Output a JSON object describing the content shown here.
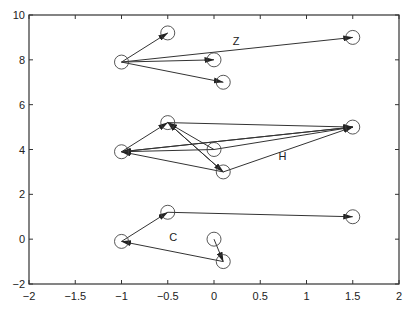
{
  "chart_data": {
    "type": "scatter",
    "title": "",
    "xlabel": "",
    "ylabel": "",
    "xlim": [
      -2,
      2
    ],
    "ylim": [
      -2,
      10
    ],
    "xticks": [
      "-2",
      "-1.5",
      "-1",
      "-0.5",
      "0",
      "0.5",
      "1",
      "1.5",
      "2"
    ],
    "yticks": [
      "-2",
      "0",
      "2",
      "4",
      "6",
      "8",
      "10"
    ],
    "grid": false,
    "legend": null,
    "groups": [
      {
        "label": "Z",
        "label_pos": [
          0.24,
          8.65
        ],
        "nodes": [
          [
            -1,
            7.9
          ],
          [
            -0.5,
            9.2
          ],
          [
            0,
            8.0
          ],
          [
            0.1,
            7.0
          ],
          [
            1.5,
            9.0
          ]
        ],
        "arrows": [
          {
            "from": [
              -1,
              7.9
            ],
            "to": [
              -0.5,
              9.2
            ]
          },
          {
            "from": [
              -1,
              7.9
            ],
            "to": [
              0,
              8.0
            ]
          },
          {
            "from": [
              -1,
              7.9
            ],
            "to": [
              0.1,
              7.0
            ]
          },
          {
            "from": [
              -1,
              7.9
            ],
            "to": [
              1.5,
              9.0
            ]
          }
        ]
      },
      {
        "label": "H",
        "label_pos": [
          0.74,
          3.55
        ],
        "nodes": [
          [
            -1,
            3.9
          ],
          [
            -0.5,
            5.2
          ],
          [
            0,
            4.0
          ],
          [
            0.1,
            3.0
          ],
          [
            1.5,
            5.0
          ]
        ],
        "arrows": [
          {
            "from": [
              -1,
              3.9
            ],
            "to": [
              -0.5,
              5.2
            ]
          },
          {
            "from": [
              1.5,
              5.0
            ],
            "to": [
              -1,
              3.9
            ]
          },
          {
            "from": [
              0,
              4.0
            ],
            "to": [
              -1,
              3.9
            ]
          },
          {
            "from": [
              0.1,
              3.0
            ],
            "to": [
              -1,
              3.9
            ]
          },
          {
            "from": [
              -0.5,
              5.2
            ],
            "to": [
              1.5,
              5.0
            ]
          },
          {
            "from": [
              -1,
              3.9
            ],
            "to": [
              1.5,
              5.0
            ]
          },
          {
            "from": [
              0,
              4.0
            ],
            "to": [
              1.5,
              5.0
            ]
          },
          {
            "from": [
              0.1,
              3.0
            ],
            "to": [
              1.5,
              5.0
            ]
          },
          {
            "from": [
              0,
              4.0
            ],
            "to": [
              -0.5,
              5.2
            ]
          },
          {
            "from": [
              0.1,
              3.0
            ],
            "to": [
              -0.5,
              5.2
            ]
          },
          {
            "from": [
              -0.5,
              5.2
            ],
            "to": [
              0.1,
              3.0
            ]
          }
        ]
      },
      {
        "label": "C",
        "label_pos": [
          -0.44,
          -0.1
        ],
        "nodes": [
          [
            0,
            0.0
          ],
          [
            0.1,
            -1.0
          ],
          [
            -1,
            -0.1
          ],
          [
            -0.5,
            1.2
          ],
          [
            1.5,
            1.0
          ]
        ],
        "arrows": [
          {
            "from": [
              0,
              0.0
            ],
            "to": [
              0.1,
              -1.0
            ]
          },
          {
            "from": [
              0.1,
              -1.0
            ],
            "to": [
              -1,
              -0.1
            ]
          },
          {
            "from": [
              -1,
              -0.1
            ],
            "to": [
              -0.5,
              1.2
            ]
          },
          {
            "from": [
              -0.5,
              1.2
            ],
            "to": [
              1.5,
              1.0
            ]
          }
        ]
      }
    ]
  }
}
